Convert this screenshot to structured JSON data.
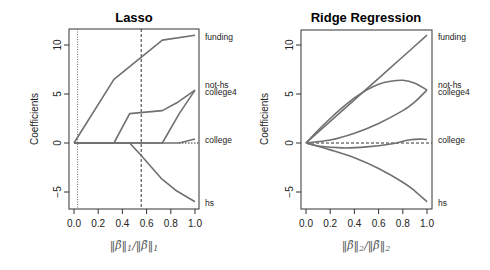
{
  "chart_data": [
    {
      "type": "line",
      "title": "Lasso",
      "xlabel": "||β̂||1/||β̃||1",
      "ylabel": "Coefficients",
      "xlim": [
        0,
        1
      ],
      "ylim": [
        -6.6,
        11.8
      ],
      "xticks": [
        "0.0",
        "0.2",
        "0.4",
        "0.6",
        "0.8",
        "1.0"
      ],
      "yticks": [
        "-5",
        "0",
        "5",
        "10"
      ],
      "grid": false,
      "legend_position": "right-margin labels",
      "vlines": [
        {
          "x": 0.03,
          "style": "dotted"
        },
        {
          "x": 0.555,
          "style": "dashed"
        }
      ],
      "hlines": [
        {
          "y": 0,
          "style": "dotted",
          "x_from": 0.87
        }
      ],
      "series": [
        {
          "name": "funding",
          "points": [
            [
              0,
              0
            ],
            [
              0.33,
              6.5
            ],
            [
              0.73,
              10.5
            ],
            [
              1.0,
              11.0
            ]
          ]
        },
        {
          "name": "not-hs",
          "points": [
            [
              0,
              0
            ],
            [
              0.33,
              0
            ],
            [
              0.46,
              3.0
            ],
            [
              0.73,
              3.3
            ],
            [
              0.85,
              4.1
            ],
            [
              1.0,
              5.4
            ]
          ]
        },
        {
          "name": "college4",
          "points": [
            [
              0,
              0
            ],
            [
              0.73,
              0
            ],
            [
              0.87,
              3.0
            ],
            [
              1.0,
              5.4
            ]
          ]
        },
        {
          "name": "college",
          "points": [
            [
              0,
              0
            ],
            [
              0.87,
              0
            ],
            [
              1.0,
              0.4
            ]
          ]
        },
        {
          "name": "hs",
          "points": [
            [
              0,
              0
            ],
            [
              0.46,
              0
            ],
            [
              0.55,
              -1.2
            ],
            [
              0.72,
              -3.6
            ],
            [
              0.85,
              -4.9
            ],
            [
              1.0,
              -6.0
            ]
          ]
        }
      ]
    },
    {
      "type": "line",
      "title": "Ridge Regression",
      "xlabel": "||β̂||2/||β̃||2",
      "ylabel": "Coefficients",
      "xlim": [
        0,
        1
      ],
      "ylim": [
        -6.6,
        11.8
      ],
      "xticks": [
        "0.0",
        "0.2",
        "0.4",
        "0.6",
        "0.8",
        "1.0"
      ],
      "yticks": [
        "-5",
        "0",
        "5",
        "10"
      ],
      "grid": false,
      "legend_position": "right-margin labels",
      "hlines": [
        {
          "y": 0,
          "style": "dashed"
        }
      ],
      "series": [
        {
          "name": "funding",
          "points": [
            [
              0,
              0
            ],
            [
              0.2,
              2.2
            ],
            [
              0.4,
              4.4
            ],
            [
              0.6,
              6.6
            ],
            [
              0.8,
              8.8
            ],
            [
              1.0,
              11.0
            ]
          ]
        },
        {
          "name": "not-hs",
          "points": [
            [
              0,
              0
            ],
            [
              0.1,
              1.3
            ],
            [
              0.2,
              2.5
            ],
            [
              0.3,
              3.6
            ],
            [
              0.4,
              4.6
            ],
            [
              0.5,
              5.4
            ],
            [
              0.6,
              6.0
            ],
            [
              0.7,
              6.3
            ],
            [
              0.8,
              6.4
            ],
            [
              0.9,
              6.1
            ],
            [
              1.0,
              5.4
            ]
          ]
        },
        {
          "name": "college4",
          "points": [
            [
              0,
              0
            ],
            [
              0.2,
              0.3
            ],
            [
              0.4,
              1.0
            ],
            [
              0.6,
              2.0
            ],
            [
              0.8,
              3.3
            ],
            [
              0.9,
              4.2
            ],
            [
              1.0,
              5.4
            ]
          ]
        },
        {
          "name": "college",
          "points": [
            [
              0,
              0
            ],
            [
              0.1,
              -0.3
            ],
            [
              0.3,
              -0.5
            ],
            [
              0.5,
              -0.4
            ],
            [
              0.7,
              -0.1
            ],
            [
              0.85,
              0.3
            ],
            [
              0.95,
              0.4
            ],
            [
              1.0,
              0.35
            ]
          ]
        },
        {
          "name": "hs",
          "points": [
            [
              0,
              0
            ],
            [
              0.2,
              -0.7
            ],
            [
              0.4,
              -1.5
            ],
            [
              0.6,
              -2.6
            ],
            [
              0.8,
              -4.0
            ],
            [
              0.9,
              -4.9
            ],
            [
              1.0,
              -6.0
            ]
          ]
        }
      ]
    }
  ],
  "panels": {
    "left": {
      "title": "Lasso",
      "ylabel": "Coefficients",
      "xlabel_main": "||β̂||",
      "labels": {
        "funding": "funding",
        "not_hs": "not-hs",
        "college4": "college4",
        "college": "college",
        "hs": "hs"
      }
    },
    "right": {
      "title": "Ridge Regression",
      "ylabel": "Coefficients",
      "labels": {
        "funding": "funding",
        "not_hs": "not-hs",
        "college4": "college4",
        "college": "college",
        "hs": "hs"
      }
    }
  },
  "ticks": {
    "x": [
      "0.0",
      "0.2",
      "0.4",
      "0.6",
      "0.8",
      "1.0"
    ],
    "y": [
      "-5",
      "0",
      "5",
      "10"
    ]
  },
  "colors": {
    "curve": "#707070",
    "frame": "#333333"
  }
}
